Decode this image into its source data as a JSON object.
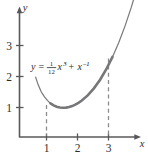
{
  "chart_data": {
    "type": "line",
    "title": "",
    "equation_label": "y = (1/12)x^3 + x^-1",
    "equation_parts": {
      "lhs": "y",
      "equals": "=",
      "frac_numerator": "1",
      "frac_denominator": "12",
      "term1_base": "x",
      "term1_exponent": "3",
      "plus": "+",
      "term2_base": "x",
      "term2_exponent": "–1"
    },
    "xlabel": "x",
    "ylabel": "y",
    "xlim": [
      -0.15,
      4.1
    ],
    "ylim": [
      -0.45,
      4.55
    ],
    "xticks": [
      1,
      2,
      3
    ],
    "xtick_labels": [
      "1",
      "2",
      "3"
    ],
    "yticks": [
      1,
      2,
      3
    ],
    "ytick_labels": [
      "1",
      "2",
      "3"
    ],
    "grid": false,
    "legend_position": "none",
    "series": [
      {
        "name": "y = (1/12)x^3 + x^-1",
        "x": [
          0.52,
          0.6,
          0.7,
          0.8,
          0.9,
          1.0,
          1.1,
          1.2,
          1.3,
          1.4,
          1.5,
          1.6,
          1.7,
          1.8,
          1.9,
          2.0,
          2.2,
          2.4,
          2.6,
          2.8,
          3.0,
          3.2,
          3.4,
          3.6,
          3.8,
          3.95
        ],
        "y": [
          1.93,
          1.69,
          1.46,
          1.3,
          1.18,
          1.083,
          1.02,
          0.977,
          0.952,
          0.943,
          0.948,
          0.966,
          0.997,
          1.042,
          1.1,
          1.167,
          1.343,
          1.569,
          1.848,
          2.186,
          2.583,
          3.044,
          3.569,
          4.165,
          4.834,
          5.39
        ]
      }
    ],
    "highlighted_interval": [
      1,
      3
    ],
    "drop_lines": [
      {
        "x": 1,
        "y_top": 1.083
      },
      {
        "x": 3,
        "y_top": 2.583
      }
    ],
    "axis_arrows": [
      "x-right",
      "y-up"
    ]
  }
}
